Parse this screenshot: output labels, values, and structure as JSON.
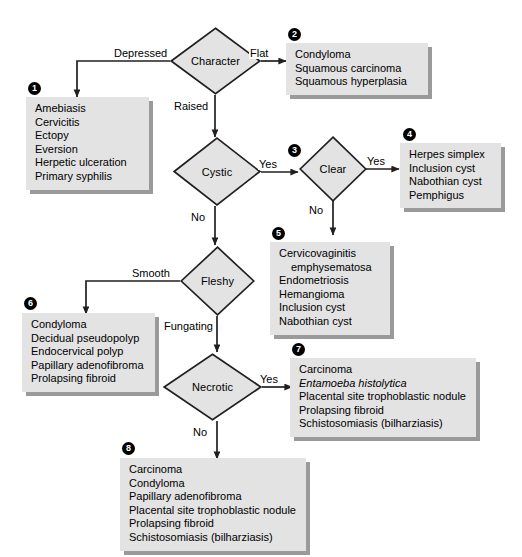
{
  "figure": {
    "kind": "clinical-decision-flowchart",
    "palette": {
      "box_fill": "#e3e3e3",
      "box_shadow": "#9a9a9a",
      "diamond_fill": "#e3e3e3",
      "stroke": "#231f20",
      "badge_fill": "#000000",
      "badge_text": "#ffffff",
      "background": "#ffffff"
    }
  },
  "decisions": [
    {
      "id": "character",
      "label": "Character"
    },
    {
      "id": "cystic",
      "label": "Cystic"
    },
    {
      "id": "clear",
      "label": "Clear"
    },
    {
      "id": "fleshy",
      "label": "Fleshy"
    },
    {
      "id": "necrotic",
      "label": "Necrotic"
    }
  ],
  "edge_labels": {
    "depressed": "Depressed",
    "flat": "Flat",
    "raised": "Raised",
    "cystic_yes": "Yes",
    "cystic_no": "No",
    "clear_yes": "Yes",
    "clear_no": "No",
    "smooth": "Smooth",
    "fungating": "Fungating",
    "necrotic_yes": "Yes",
    "necrotic_no": "No"
  },
  "outcomes": [
    {
      "number": "1",
      "from": "character / Depressed",
      "items": [
        {
          "text": "Amebiasis",
          "style": "normal"
        },
        {
          "text": "Cervicitis",
          "style": "normal"
        },
        {
          "text": "Ectopy",
          "style": "normal"
        },
        {
          "text": "Eversion",
          "style": "normal"
        },
        {
          "text": "Herpetic ulceration",
          "style": "normal"
        },
        {
          "text": "Primary syphilis",
          "style": "normal"
        }
      ]
    },
    {
      "number": "2",
      "from": "character / Flat",
      "items": [
        {
          "text": "Condyloma",
          "style": "normal"
        },
        {
          "text": "Squamous carcinoma",
          "style": "normal"
        },
        {
          "text": "Squamous hyperplasia",
          "style": "normal"
        }
      ]
    },
    {
      "number": "3",
      "from": "cystic / Yes",
      "items": []
    },
    {
      "number": "4",
      "from": "clear / Yes",
      "items": [
        {
          "text": "Herpes simplex",
          "style": "normal"
        },
        {
          "text": "Inclusion cyst",
          "style": "normal"
        },
        {
          "text": "Nabothian cyst",
          "style": "normal"
        },
        {
          "text": "Pemphigus",
          "style": "normal"
        }
      ]
    },
    {
      "number": "5",
      "from": "clear / No",
      "items": [
        {
          "text": "Cervicovaginitis",
          "style": "normal"
        },
        {
          "text": "emphysematosa",
          "style": "indent"
        },
        {
          "text": "Endometriosis",
          "style": "normal"
        },
        {
          "text": "Hemangioma",
          "style": "normal"
        },
        {
          "text": "Inclusion cyst",
          "style": "normal"
        },
        {
          "text": "Nabothian cyst",
          "style": "normal"
        }
      ]
    },
    {
      "number": "6",
      "from": "fleshy / Smooth",
      "items": [
        {
          "text": "Condyloma",
          "style": "normal"
        },
        {
          "text": "Decidual pseudopolyp",
          "style": "normal"
        },
        {
          "text": "Endocervical polyp",
          "style": "normal"
        },
        {
          "text": "Papillary adenofibroma",
          "style": "normal"
        },
        {
          "text": "Prolapsing fibroid",
          "style": "normal"
        }
      ]
    },
    {
      "number": "7",
      "from": "necrotic / Yes",
      "items": [
        {
          "text": "Carcinoma",
          "style": "normal"
        },
        {
          "text": "Entamoeba histolytica",
          "style": "italic"
        },
        {
          "text": "Placental site trophoblastic nodule",
          "style": "normal"
        },
        {
          "text": "Prolapsing fibroid",
          "style": "normal"
        },
        {
          "text": "Schistosomiasis (bilharziasis)",
          "style": "normal"
        }
      ]
    },
    {
      "number": "8",
      "from": "necrotic / No",
      "items": [
        {
          "text": "Carcinoma",
          "style": "normal"
        },
        {
          "text": "Condyloma",
          "style": "normal"
        },
        {
          "text": "Papillary adenofibroma",
          "style": "normal"
        },
        {
          "text": "Placental site trophoblastic nodule",
          "style": "normal"
        },
        {
          "text": "Prolapsing fibroid",
          "style": "normal"
        },
        {
          "text": "Schistosomiasis (bilharziasis)",
          "style": "normal"
        }
      ]
    }
  ]
}
